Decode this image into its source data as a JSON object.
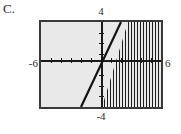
{
  "choice": {
    "label": "C."
  },
  "chart_data": {
    "type": "line",
    "title": "",
    "subtitle": "",
    "xlabel": "",
    "ylabel": "",
    "xlim": [
      -6,
      6
    ],
    "ylim": [
      -4,
      4
    ],
    "grid": false,
    "legend": null,
    "axis_labels": {
      "top": "4",
      "bottom": "-4",
      "left": "-6",
      "right": "6"
    },
    "x_ticks": [
      -5,
      -4,
      -3,
      -2,
      -1,
      1,
      2,
      3,
      4,
      5
    ],
    "y_ticks": [
      -3,
      -2,
      -1,
      1,
      2,
      3
    ],
    "series": [
      {
        "name": "boundary-line",
        "kind": "line",
        "equation": "y = 2x",
        "slope": 2,
        "intercept": 0,
        "style": "solid",
        "color": "#131313",
        "points": [
          [
            -2,
            -4
          ],
          [
            2,
            4
          ]
        ]
      },
      {
        "name": "shaded-region",
        "kind": "inequality-region",
        "inequality": "y <= 2x",
        "side": "right-of-line",
        "fill": "vertical-hatch",
        "color": "#1c1c1c"
      }
    ],
    "plot_background": "#e9e9e9",
    "frame_color": "#3a3a3a",
    "axis_color": "#1a1a1a"
  }
}
